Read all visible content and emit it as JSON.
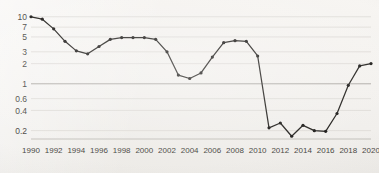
{
  "chart_data": {
    "type": "line",
    "title": "",
    "subtitle": "",
    "xlabel": "",
    "ylabel": "",
    "yscale": "log",
    "grid": true,
    "legend": false,
    "legend_position": "none",
    "ylim": [
      0.15,
      11
    ],
    "xlim": [
      1990,
      2020
    ],
    "y_ticks": [
      10,
      7,
      5,
      3,
      2,
      1,
      0.6,
      0.4,
      0.2
    ],
    "y_tick_labels": [
      "10",
      "7",
      "5",
      "3",
      "2",
      "1",
      "0.6",
      "0.4",
      "0.2"
    ],
    "x_ticks": [
      1990,
      1992,
      1994,
      1996,
      1998,
      2000,
      2002,
      2004,
      2006,
      2008,
      2010,
      2012,
      2014,
      2016,
      2018,
      2020
    ],
    "x_tick_labels": [
      "1990",
      "1992",
      "1994",
      "1996",
      "1998",
      "2000",
      "2002",
      "2004",
      "2006",
      "2008",
      "2010",
      "2012",
      "2014",
      "2016",
      "2018",
      "2020"
    ],
    "x": [
      1990,
      1991,
      1992,
      1993,
      1994,
      1995,
      1996,
      1997,
      1998,
      1999,
      2000,
      2001,
      2002,
      2003,
      2004,
      2005,
      2006,
      2007,
      2008,
      2009,
      2010,
      2011,
      2012,
      2013,
      2014,
      2015,
      2016,
      2017,
      2018,
      2019,
      2020
    ],
    "series": [
      {
        "name": "series-1",
        "color": "#24221f",
        "markers": true,
        "values": [
          10,
          9.2,
          6.6,
          4.3,
          3.1,
          2.8,
          3.6,
          4.6,
          4.9,
          4.9,
          4.9,
          4.6,
          3.0,
          1.35,
          1.2,
          1.45,
          2.5,
          4.1,
          4.4,
          4.3,
          2.6,
          0.22,
          0.26,
          0.165,
          0.24,
          0.2,
          0.195,
          0.36,
          0.95,
          1.85,
          2.0
        ]
      }
    ],
    "points_count": 31
  }
}
